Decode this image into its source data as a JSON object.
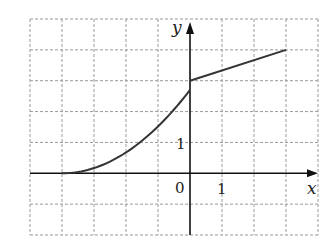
{
  "chart_data": {
    "type": "line",
    "title": "",
    "xlabel": "x",
    "ylabel": "y",
    "xlim": [
      -5,
      4
    ],
    "ylim": [
      -2,
      5
    ],
    "grid": true,
    "grid_style": "dashed",
    "tick_labels": {
      "origin": "0",
      "x_unit": "1",
      "y_unit": "1"
    },
    "series": [
      {
        "name": "curve (left piece)",
        "kind": "curve",
        "x": [
          -5,
          -4,
          -3,
          -2,
          -1,
          0
        ],
        "y": [
          0,
          0,
          0.17,
          0.67,
          1.5,
          2.7
        ],
        "end_open": false
      },
      {
        "name": "line (right piece)",
        "kind": "segment",
        "x": [
          0,
          3
        ],
        "y": [
          3,
          4
        ]
      }
    ],
    "colors": {
      "curve": "#333333",
      "axis": "#111111",
      "grid": "#9a9a9a"
    }
  },
  "labels": {
    "x_axis": "x",
    "y_axis": "y",
    "origin": "0",
    "x_tick_1": "1",
    "y_tick_1": "1"
  }
}
